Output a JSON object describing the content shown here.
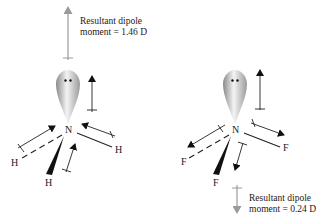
{
  "molecules": [
    {
      "name": "NH3",
      "central_atom": "N",
      "substituents": [
        "H",
        "H",
        "H"
      ],
      "bond_dipole_direction": "toward N",
      "lone_pair_dipole_direction": "up",
      "resultant": {
        "line1": "Resultant dipole",
        "line2": "moment = 1.46 D",
        "direction": "up",
        "value_D": 1.46
      }
    },
    {
      "name": "NF3",
      "central_atom": "N",
      "substituents": [
        "F",
        "F",
        "F"
      ],
      "bond_dipole_direction": "toward F",
      "lone_pair_dipole_direction": "up",
      "resultant": {
        "line1": "Resultant dipole",
        "line2": "moment = 0.24 D",
        "direction": "down",
        "value_D": 0.24
      }
    }
  ],
  "colors": {
    "ink": "#1a1a1a",
    "resultant_arrow": "#9a9a9a",
    "lone_pair_light": "#f2f2f2",
    "lone_pair_dark": "#9c9c9c"
  }
}
